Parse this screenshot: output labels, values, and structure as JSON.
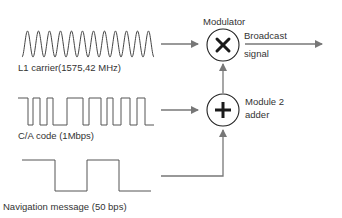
{
  "diagram": {
    "inputs": [
      {
        "name": "l1-carrier",
        "label": "L1 carrier(1575,42 MHz)",
        "waveform": "sine"
      },
      {
        "name": "ca-code",
        "label": "C/A code (1Mbps)",
        "waveform": "square-pseudorandom"
      },
      {
        "name": "navigation-message",
        "label": "Navigation message (50 bps)",
        "waveform": "square"
      }
    ],
    "operators": [
      {
        "name": "modulator",
        "label": "Modulator",
        "symbol": "×"
      },
      {
        "name": "adder",
        "label_line1": "Module 2",
        "label_line2": "adder",
        "symbol": "+"
      }
    ],
    "output": {
      "label_line1": "Broadcast",
      "label_line2": "signal"
    },
    "colors": {
      "line": "#555555",
      "arrow": "#777777",
      "symbol": "#1a1a1a",
      "text": "#333333"
    }
  }
}
